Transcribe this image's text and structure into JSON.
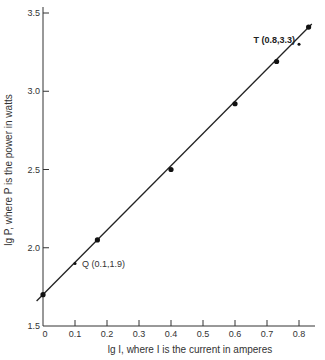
{
  "chart_data": {
    "type": "line",
    "title": "",
    "xlabel": "lg I, where I is the current in amperes",
    "ylabel": "lg P, where P is the power in watts",
    "xlim": [
      0,
      0.85
    ],
    "ylim": [
      1.5,
      3.5
    ],
    "grid": false,
    "x_ticks": [
      "0",
      "0.1",
      "0.2",
      "0.3",
      "0.4",
      "0.5",
      "0.6",
      "0.7",
      "0.8"
    ],
    "y_ticks": [
      "1.5",
      "2.0",
      "2.5",
      "3.0",
      "3.5"
    ],
    "series": [
      {
        "name": "measured points",
        "x": [
          0,
          0.17,
          0.4,
          0.6,
          0.73,
          0.83
        ],
        "y": [
          1.7,
          2.05,
          2.5,
          2.92,
          3.19,
          3.41
        ]
      }
    ],
    "fit_line": {
      "x": [
        -0.02,
        0.84
      ],
      "y": [
        1.66,
        3.43
      ]
    },
    "annotations": [
      {
        "label": "Q (0.1,1.9)",
        "x": 0.1,
        "y": 1.9
      },
      {
        "label": "T (0.8,3.3)",
        "x": 0.8,
        "y": 3.3
      }
    ]
  },
  "labels": {
    "xlabel": "lg I, where I is the current in amperes",
    "ylabel": "lg P, where P is the power in watts",
    "q": "Q (0.1,1.9)",
    "t": "T (0.8,3.3)"
  }
}
